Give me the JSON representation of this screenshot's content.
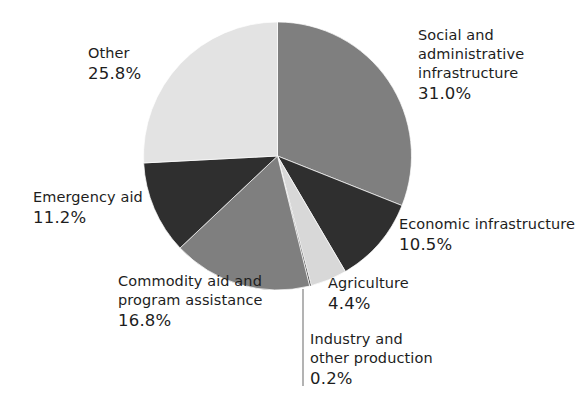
{
  "chart_data": {
    "type": "pie",
    "title": "",
    "subtitle": "",
    "xlabel": "",
    "ylabel": "",
    "legend_position": "none",
    "grid": false,
    "units": "percent",
    "start_angle_deg": 0,
    "direction": "clockwise",
    "categories": [
      "Social and administrative infrastructure",
      "Economic infrastructure",
      "Agriculture",
      "Industry and other production",
      "Commodity aid and program assistance",
      "Emergency aid",
      "Other"
    ],
    "values": [
      31.0,
      10.5,
      4.4,
      0.2,
      16.8,
      11.2,
      25.8
    ],
    "slices": [
      {
        "name": "social-and-administrative-infrastructure",
        "label": "Social and\nadministrative\ninfrastructure",
        "label_lines": [
          "Social and",
          "administrative",
          "infrastructure"
        ],
        "value": 31.0,
        "value_text": "31.0%",
        "color": "#7f7f7f"
      },
      {
        "name": "economic-infrastructure",
        "label": "Economic infrastructure",
        "label_lines": [
          "Economic infrastructure"
        ],
        "value": 10.5,
        "value_text": "10.5%",
        "color": "#2f2f2f"
      },
      {
        "name": "agriculture",
        "label": "Agriculture",
        "label_lines": [
          "Agriculture"
        ],
        "value": 4.4,
        "value_text": "4.4%",
        "color": "#d8d8d8"
      },
      {
        "name": "industry-and-other-production",
        "label": "Industry and\nother production",
        "label_lines": [
          "Industry and",
          "other production"
        ],
        "value": 0.2,
        "value_text": "0.2%",
        "color": "#2f2f2f"
      },
      {
        "name": "commodity-aid-and-program-assistance",
        "label": "Commodity aid and\nprogram assistance",
        "label_lines": [
          "Commodity aid and",
          "program assistance"
        ],
        "value": 16.8,
        "value_text": "16.8%",
        "color": "#7f7f7f"
      },
      {
        "name": "emergency-aid",
        "label": "Emergency aid",
        "label_lines": [
          "Emergency aid"
        ],
        "value": 11.2,
        "value_text": "11.2%",
        "color": "#2f2f2f"
      },
      {
        "name": "other",
        "label": "Other",
        "label_lines": [
          "Other"
        ],
        "value": 25.8,
        "value_text": "25.8%",
        "color": "#e3e3e3"
      }
    ]
  },
  "labels": {
    "social": {
      "line1": "Social and",
      "line2": "administrative",
      "line3": "infrastructure",
      "pct": "31.0%"
    },
    "economic": {
      "line1": "Economic infrastructure",
      "pct": "10.5%"
    },
    "agriculture": {
      "line1": "Agriculture",
      "pct": "4.4%"
    },
    "industry": {
      "line1": "Industry and",
      "line2": "other production",
      "pct": "0.2%"
    },
    "commodity": {
      "line1": "Commodity aid and",
      "line2": "program assistance",
      "pct": "16.8%"
    },
    "emergency": {
      "line1": "Emergency aid",
      "pct": "11.2%"
    },
    "other": {
      "line1": "Other",
      "pct": "25.8%"
    }
  },
  "geometry": {
    "center_x": 277.5,
    "center_y": 156,
    "radius": 134,
    "leader_line_x": 303,
    "leader_line_y1": 289,
    "leader_line_y2": 386
  },
  "colors": {
    "background": "#ffffff",
    "text": "#1d1d1d",
    "slice_light": "#e3e3e3",
    "slice_light2": "#d8d8d8",
    "slice_mid": "#7f7f7f",
    "slice_dark": "#2f2f2f",
    "leader_line": "#8a8a8a"
  }
}
